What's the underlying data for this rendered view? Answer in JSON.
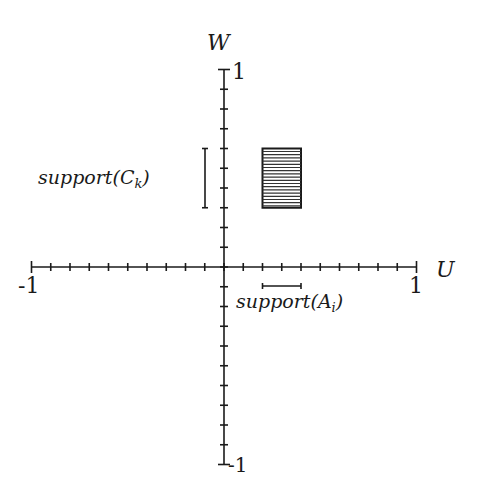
{
  "chart_data": {
    "type": "diagram",
    "axes": {
      "x_label": "U",
      "y_label": "W",
      "x_range": [
        -1,
        1
      ],
      "y_range": [
        -1,
        1
      ],
      "tick_step": 0.1,
      "x_tick_labels": {
        "min": "-1",
        "max": "1"
      },
      "y_tick_labels": {
        "min": "-1",
        "max": "1"
      }
    },
    "rectangle": {
      "u": [
        0.2,
        0.4
      ],
      "w": [
        0.3,
        0.6
      ],
      "fill": "horizontal-hatch"
    },
    "support_A": {
      "label_main": "support(A",
      "label_sub": "i",
      "label_close": ")",
      "u": [
        0.2,
        0.4
      ]
    },
    "support_C": {
      "label_main": "support(C",
      "label_sub": "k",
      "label_close": ")",
      "w": [
        0.3,
        0.6
      ]
    }
  },
  "colors": {
    "ink": "#1a1a1a",
    "background": "#ffffff"
  }
}
